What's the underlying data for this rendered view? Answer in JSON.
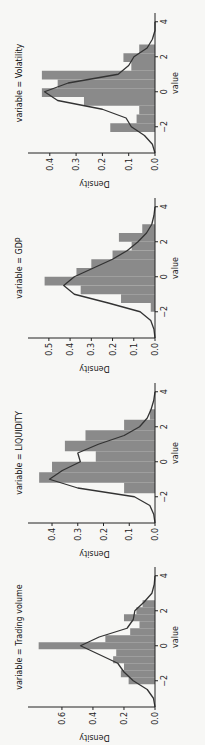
{
  "figure": {
    "orientation": "rotated-90-ccw",
    "background": "#f7f7f5",
    "bar_color": "#8a8a8a",
    "line_color": "#333333"
  },
  "chart_data": [
    {
      "type": "bar",
      "title": "variable = Trading volume",
      "xlabel": "value",
      "ylabel": "Density",
      "xlim": [
        -3.5,
        4.5
      ],
      "ylim": [
        0,
        0.78
      ],
      "xticks": [
        "-2",
        "0",
        "2",
        "4"
      ],
      "xtick_values": [
        -2,
        0,
        2,
        4
      ],
      "yticks": [
        "0.0",
        "0.2",
        "0.4",
        "0.6"
      ],
      "ytick_values": [
        0,
        0.2,
        0.4,
        0.6
      ],
      "grid": false,
      "bins": [
        -2.2,
        -1.8,
        -1.4,
        -1.0,
        -0.6,
        -0.2,
        0.2,
        0.6,
        1.0,
        1.4,
        1.8,
        2.2,
        2.6
      ],
      "values": [
        0.17,
        0.22,
        0.2,
        0.27,
        0.25,
        0.75,
        0.32,
        0.16,
        0.1,
        0.2,
        0.12,
        0.08
      ],
      "kde": {
        "x": [
          -3.5,
          -3,
          -2.5,
          -2,
          -1.5,
          -1,
          -0.5,
          0,
          0.5,
          1,
          1.5,
          2,
          2.5,
          3,
          3.5,
          4
        ],
        "y": [
          0.0,
          0.01,
          0.05,
          0.14,
          0.2,
          0.24,
          0.36,
          0.48,
          0.36,
          0.18,
          0.14,
          0.13,
          0.07,
          0.02,
          0.005,
          0.0
        ]
      }
    },
    {
      "type": "bar",
      "title": "variable = LIQUIDITY",
      "xlabel": "value",
      "ylabel": "Density",
      "xlim": [
        -3.5,
        4.5
      ],
      "ylim": [
        0,
        0.47
      ],
      "xticks": [
        "-2",
        "0",
        "2",
        "4"
      ],
      "xtick_values": [
        -2,
        0,
        2,
        4
      ],
      "yticks": [
        "0.0",
        "0.1",
        "0.2",
        "0.3",
        "0.4"
      ],
      "ytick_values": [
        0,
        0.1,
        0.2,
        0.3,
        0.4
      ],
      "grid": false,
      "bins": [
        -1.8,
        -1.2,
        -0.6,
        0.0,
        0.6,
        1.2,
        1.8,
        2.4,
        3.0
      ],
      "values": [
        0.12,
        0.45,
        0.4,
        0.23,
        0.35,
        0.27,
        0.12,
        0.02,
        0.0
      ],
      "kde": {
        "x": [
          -3.5,
          -3,
          -2.5,
          -2,
          -1.5,
          -1,
          -0.5,
          0,
          0.5,
          1,
          1.5,
          2,
          2.5,
          3,
          3.5,
          4
        ],
        "y": [
          0.0,
          0.005,
          0.02,
          0.08,
          0.3,
          0.41,
          0.36,
          0.29,
          0.3,
          0.22,
          0.12,
          0.06,
          0.03,
          0.015,
          0.005,
          0.0
        ]
      }
    },
    {
      "type": "bar",
      "title": "variable = GDP",
      "xlabel": "value",
      "ylabel": "Density",
      "xlim": [
        -3.5,
        4.5
      ],
      "ylim": [
        0,
        0.57
      ],
      "xticks": [
        "-2",
        "0",
        "2",
        "4"
      ],
      "xtick_values": [
        -2,
        0,
        2,
        4
      ],
      "yticks": [
        "0.0",
        "0.1",
        "0.2",
        "0.3",
        "0.4",
        "0.5"
      ],
      "ytick_values": [
        0,
        0.1,
        0.2,
        0.3,
        0.4,
        0.5
      ],
      "grid": false,
      "bins": [
        -2.0,
        -1.5,
        -1.0,
        -0.5,
        0.0,
        0.5,
        1.0,
        1.5,
        2.0,
        2.5,
        3.0
      ],
      "values": [
        0.02,
        0.16,
        0.35,
        0.52,
        0.37,
        0.3,
        0.2,
        0.11,
        0.17,
        0.06,
        0.03
      ],
      "kde": {
        "x": [
          -3.5,
          -3,
          -2.5,
          -2,
          -1.5,
          -1,
          -0.5,
          0,
          0.5,
          1,
          1.5,
          2,
          2.5,
          3,
          3.5,
          4
        ],
        "y": [
          0.0,
          0.005,
          0.02,
          0.07,
          0.22,
          0.38,
          0.43,
          0.38,
          0.29,
          0.2,
          0.13,
          0.08,
          0.04,
          0.015,
          0.005,
          0.0
        ]
      }
    },
    {
      "type": "bar",
      "title": "variable = Volatility",
      "xlabel": "value",
      "ylabel": "Density",
      "xlim": [
        -3.5,
        4.5
      ],
      "ylim": [
        0,
        0.46
      ],
      "xticks": [
        "-2",
        "0",
        "2",
        "4"
      ],
      "xtick_values": [
        -2,
        0,
        2,
        4
      ],
      "yticks": [
        "0.0",
        "0.1",
        "0.2",
        "0.3",
        "0.4"
      ],
      "ytick_values": [
        0,
        0.1,
        0.2,
        0.3,
        0.4
      ],
      "grid": false,
      "bins": [
        -2.3,
        -1.8,
        -1.3,
        -0.8,
        -0.3,
        0.2,
        0.7,
        1.2,
        1.7,
        2.2,
        2.7
      ],
      "values": [
        0.17,
        0.07,
        0.06,
        0.27,
        0.43,
        0.37,
        0.43,
        0.09,
        0.12,
        0.06,
        0.0
      ],
      "kde": {
        "x": [
          -3.5,
          -3,
          -2.5,
          -2,
          -1.5,
          -1,
          -0.5,
          0,
          0.5,
          1,
          1.5,
          2,
          2.5,
          3,
          3.5,
          4
        ],
        "y": [
          0.0,
          0.01,
          0.04,
          0.09,
          0.11,
          0.2,
          0.37,
          0.42,
          0.33,
          0.14,
          0.1,
          0.08,
          0.03,
          0.01,
          0.0,
          0.0
        ]
      }
    }
  ]
}
